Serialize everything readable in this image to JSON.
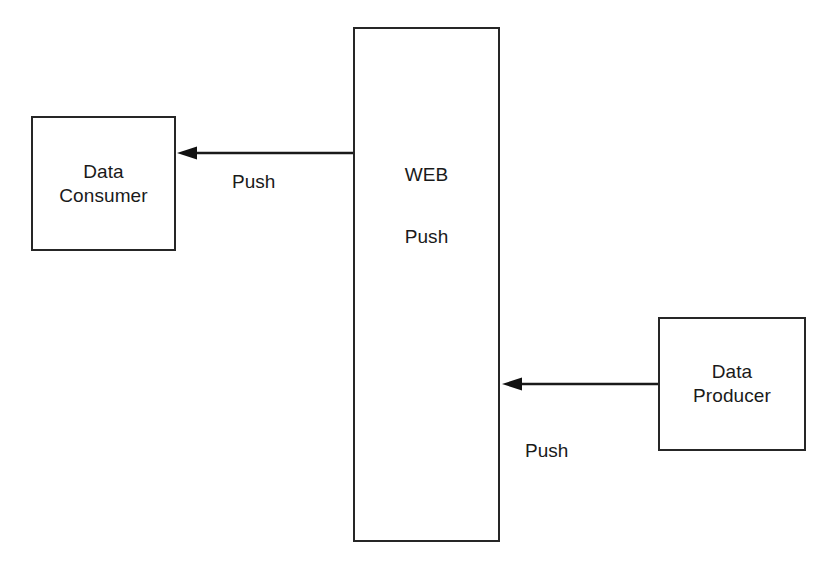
{
  "diagram": {
    "background_color": "#ffffff",
    "stroke_color": "#262626",
    "text_color": "#1a1a1a",
    "nodes": [
      {
        "id": "data-consumer",
        "label": "Data\nConsumer",
        "shape": "rectangle",
        "x": 31,
        "y": 116,
        "width": 145,
        "height": 135
      },
      {
        "id": "web",
        "label_primary": "WEB",
        "label_secondary": "Push",
        "shape": "rectangle",
        "x": 353,
        "y": 27,
        "width": 147,
        "height": 515
      },
      {
        "id": "data-producer",
        "label": "Data\nProducer",
        "shape": "rectangle",
        "x": 658,
        "y": 317,
        "width": 148,
        "height": 134
      }
    ],
    "edges": [
      {
        "id": "web-to-consumer",
        "label": "Push",
        "from": "web",
        "to": "data-consumer",
        "direction": "right-to-left",
        "arrowhead": "filled-triangle"
      },
      {
        "id": "producer-to-web",
        "label": "Push",
        "from": "data-producer",
        "to": "web",
        "direction": "right-to-left",
        "arrowhead": "filled-triangle"
      }
    ]
  }
}
